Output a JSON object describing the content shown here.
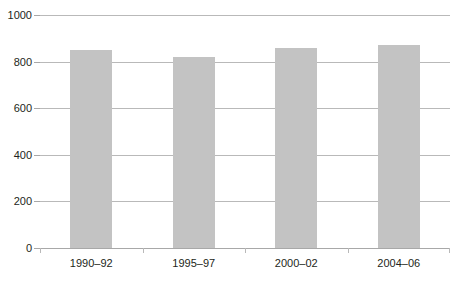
{
  "chart_data": {
    "type": "bar",
    "title": "",
    "subtitle": "",
    "xlabel": "",
    "ylabel": "",
    "categories": [
      "1990–92",
      "1995–97",
      "2000–02",
      "2004–06"
    ],
    "values": [
      848,
      820,
      858,
      871
    ],
    "series": [
      {
        "name": "",
        "values": [
          848,
          820,
          858,
          871
        ]
      }
    ],
    "ylim": [
      0,
      1000
    ],
    "yticks": [
      0,
      200,
      400,
      600,
      800,
      1000
    ],
    "ytick_labels": [
      "0",
      "200",
      "400",
      "600",
      "800",
      "1000"
    ],
    "grid": true,
    "grid_axis": "y",
    "legend": false,
    "legend_position": "none",
    "bar_color": "#c3c3c3",
    "gridline_color": "#b9b9b9",
    "axis_color": "#a8a8a8",
    "text_color": "#231f20",
    "background_color": "#ffffff",
    "annotations": []
  },
  "chart": {
    "title_text": "",
    "y_axis": {
      "ticks": [
        {
          "label": "1000",
          "value": 1000
        },
        {
          "label": "800",
          "value": 800
        },
        {
          "label": "600",
          "value": 600
        },
        {
          "label": "400",
          "value": 400
        },
        {
          "label": "200",
          "value": 200
        },
        {
          "label": "0",
          "value": 0
        }
      ]
    },
    "x_axis": {
      "ticks": [
        {
          "label": "1990–92"
        },
        {
          "label": "1995–97"
        },
        {
          "label": "2000–02"
        },
        {
          "label": "2004–06"
        }
      ]
    },
    "bars": [
      {
        "category": "1990–92",
        "value": 848
      },
      {
        "category": "1995–97",
        "value": 820
      },
      {
        "category": "2000–02",
        "value": 858
      },
      {
        "category": "2004–06",
        "value": 871
      }
    ]
  }
}
